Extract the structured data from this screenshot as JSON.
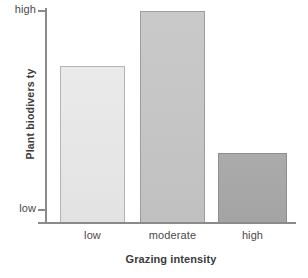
{
  "chart_data": {
    "type": "bar",
    "title": "",
    "subtitle": "",
    "xlabel": "Grazing intensity",
    "ylabel": "Plant biodivers ty",
    "categories": [
      "low",
      "moderate",
      "high"
    ],
    "values": [
      0.74,
      1.0,
      0.33
    ],
    "series": [
      {
        "name": "Plant biodiversity",
        "values": [
          0.74,
          1.0,
          0.33
        ]
      }
    ],
    "ytick_labels": [
      "low",
      "high"
    ],
    "ylim": [
      0,
      1
    ],
    "ytick_values": [
      0,
      1
    ],
    "grid": false,
    "legend": false,
    "legend_position": "none",
    "annotations": [],
    "bar_colors": [
      "#e6e6e6",
      "#c5c5c5",
      "#a7a7a7"
    ],
    "bar_border_colors": [
      "#b4b4b4",
      "#9d9d9d",
      "#8e8e8e"
    ],
    "axis_color": "#8a8a8a",
    "text_color": "#4a4a4a",
    "title_color": "#3c3c3c",
    "background": "#ffffff"
  },
  "axes": {
    "y": {
      "title": "Plant biodivers ty",
      "ticks": {
        "high": "high",
        "low": "low"
      }
    },
    "x": {
      "title": "Grazing intensity",
      "ticks": {
        "low": "low",
        "moderate": "moderate",
        "high": "high"
      }
    }
  }
}
